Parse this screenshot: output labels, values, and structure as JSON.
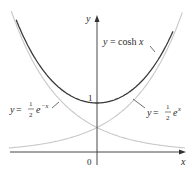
{
  "chart_data": {
    "type": "line",
    "title": "",
    "xlabel": "x",
    "ylabel": "y",
    "grid": false,
    "legend": "inline annotations",
    "xlim": [
      -1.75,
      1.8
    ],
    "ylim": [
      -0.25,
      2.8
    ],
    "ticks": {
      "origin_label": "0",
      "y_tick_label": "1"
    },
    "series": [
      {
        "name": "y = cosh x",
        "function": "cosh(x)",
        "color": "#3a3a3a",
        "style": "dark solid",
        "points": [
          [
            -1.6,
            2.58
          ],
          [
            -1.2,
            1.81
          ],
          [
            -0.8,
            1.34
          ],
          [
            -0.4,
            1.08
          ],
          [
            0,
            1.0
          ],
          [
            0.4,
            1.08
          ],
          [
            0.8,
            1.34
          ],
          [
            1.2,
            1.81
          ],
          [
            1.6,
            2.58
          ]
        ]
      },
      {
        "name": "y = ½e^(−x)",
        "function": "0.5*exp(-x)",
        "color": "#c8c8c8",
        "style": "light solid",
        "points": [
          [
            -1.6,
            2.48
          ],
          [
            -1.2,
            1.66
          ],
          [
            -0.8,
            1.11
          ],
          [
            -0.4,
            0.75
          ],
          [
            0,
            0.5
          ],
          [
            0.4,
            0.34
          ],
          [
            0.8,
            0.22
          ],
          [
            1.2,
            0.15
          ],
          [
            1.6,
            0.1
          ]
        ]
      },
      {
        "name": "y = ½e^x",
        "function": "0.5*exp(x)",
        "color": "#c8c8c8",
        "style": "light solid",
        "points": [
          [
            -1.6,
            0.1
          ],
          [
            -1.2,
            0.15
          ],
          [
            -0.8,
            0.22
          ],
          [
            -0.4,
            0.34
          ],
          [
            0,
            0.5
          ],
          [
            0.4,
            0.75
          ],
          [
            0.8,
            1.11
          ],
          [
            1.2,
            1.66
          ],
          [
            1.6,
            2.48
          ]
        ]
      }
    ],
    "annotations": [
      {
        "text": "y = cosh x",
        "points_to": "cosh curve, right branch"
      },
      {
        "text": "y = ½ e^(−x)",
        "points_to": "left decaying exponential"
      },
      {
        "text": "y = ½ e^x",
        "points_to": "right growing exponential"
      }
    ]
  },
  "labels": {
    "y_axis": "y",
    "x_axis": "x",
    "origin": "0",
    "one": "1",
    "cosh": {
      "lhs": "y = ",
      "rhs": "cosh x"
    },
    "left_exp": {
      "lhs": "y = ",
      "num": "1",
      "den": "2",
      "base": "e",
      "exp": "−x"
    },
    "right_exp": {
      "lhs": "y = ",
      "num": "1",
      "den": "2",
      "base": "e",
      "exp": "x"
    }
  }
}
